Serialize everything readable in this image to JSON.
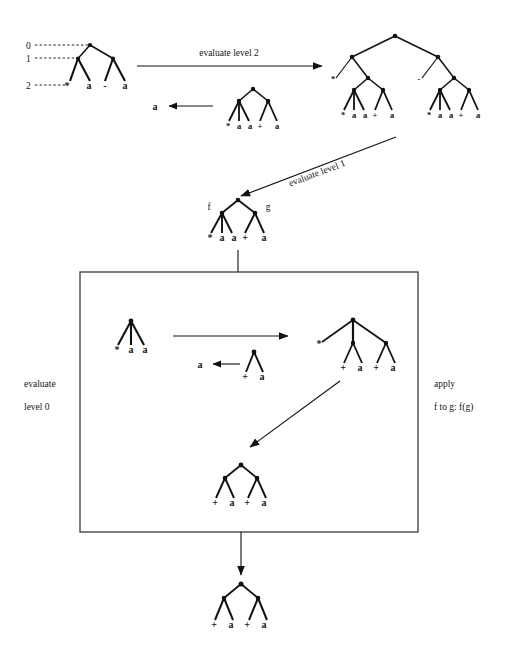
{
  "figure": {
    "title": "",
    "background": "#ffffff",
    "ink": "#111111"
  },
  "level_rulers": {
    "labels": [
      "0",
      "1",
      "2"
    ]
  },
  "arrows": [
    {
      "name": "evaluate-level-2",
      "label": "evaluate level 2"
    },
    {
      "name": "evaluate-level-1",
      "label": "evaluate level 1"
    },
    {
      "name": "box-in",
      "label": ""
    },
    {
      "name": "box-out",
      "label": ""
    },
    {
      "name": "inner-transform",
      "label": ""
    },
    {
      "name": "inner-diagonal",
      "label": ""
    }
  ],
  "side_labels": {
    "left_line1": "evaluate",
    "left_line2": "level 0",
    "right_line1": "apply",
    "right_line2": "f to g: f(g)"
  },
  "reductions": [
    {
      "name": "reduction-top",
      "result": "a"
    },
    {
      "name": "reduction-inner",
      "result": "a"
    }
  ],
  "branch_labels": {
    "f": "f",
    "g": "g",
    "star_left": "*",
    "minus_right": "-"
  },
  "trees": {
    "tree_source": {
      "name": "source-expression-tree",
      "leaves": [
        "*",
        "a",
        "-",
        "a"
      ]
    },
    "tree_top_right": {
      "name": "expanded-tree-level-2",
      "left_branch_label": "*",
      "right_branch_label": "-",
      "left_leaves": [
        "*",
        "a",
        "a",
        "+",
        "a"
      ],
      "right_leaves": [
        "*",
        "a",
        "a",
        "+",
        "a"
      ]
    },
    "tree_reduction_top": {
      "name": "reduction-subtree-top",
      "leaves": [
        "*",
        "a",
        "a",
        "+",
        "a"
      ]
    },
    "tree_middle": {
      "name": "tree-f-g",
      "left_branch_label": "f",
      "right_branch_label": "g",
      "leaves": [
        "*",
        "a",
        "a",
        "+",
        "a"
      ]
    },
    "tree_box_left": {
      "name": "tree-box-left",
      "leaves": [
        "*",
        "a",
        "a"
      ]
    },
    "tree_box_reduction": {
      "name": "tree-box-reduction",
      "leaves": [
        "+",
        "a"
      ]
    },
    "tree_box_right": {
      "name": "tree-box-right",
      "root_left_leaf": "*",
      "mid_leaves": [
        "+",
        "a"
      ],
      "right_leaves": [
        "+",
        "a"
      ]
    },
    "tree_box_bottom": {
      "name": "tree-box-bottom",
      "left_leaves": [
        "+",
        "a"
      ],
      "right_leaves": [
        "+",
        "a"
      ]
    },
    "tree_final": {
      "name": "tree-final-result",
      "left_leaves": [
        "+",
        "a"
      ],
      "right_leaves": [
        "+",
        "a"
      ]
    }
  }
}
